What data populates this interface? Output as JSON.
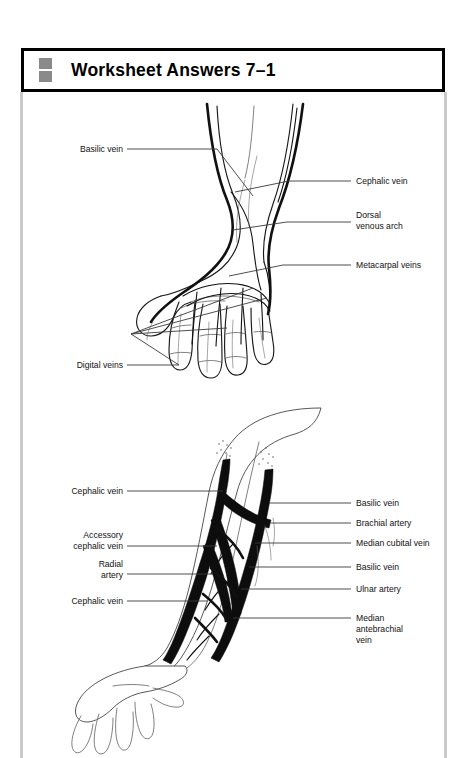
{
  "page": {
    "background_color": "#ffffff",
    "rail_color": "#c9c9c9",
    "ink_color": "#111111"
  },
  "header": {
    "title": "Worksheet Answers 7–1",
    "icon_name": "two-stacked-squares-icon",
    "icon_color": "#8a8a8a",
    "border_color": "#000000"
  },
  "figures": [
    {
      "id": "dorsal-hand-veins",
      "caption": "Dorsal view of hand and wrist superficial veins",
      "labels_left": [
        {
          "text": "Basilic vein",
          "x": 42,
          "y": 56
        },
        {
          "text": "Digital veins",
          "x": 42,
          "y": 272
        }
      ],
      "labels_right": [
        {
          "text": "Cephalic vein",
          "x": 335,
          "y": 88
        },
        {
          "text": "Dorsal",
          "x": 335,
          "y": 122
        },
        {
          "text": "venous arch",
          "x": 335,
          "y": 133
        },
        {
          "text": "Metacarpal veins",
          "x": 335,
          "y": 172
        }
      ]
    },
    {
      "id": "anterior-forearm-veins",
      "caption": "Anterior view of forearm veins and arteries",
      "labels_left": [
        {
          "text": "Cephalic vein",
          "x": 185,
          "y": 98
        },
        {
          "text": "Accessory",
          "x": 185,
          "y": 142
        },
        {
          "text": "cephalic vein",
          "x": 185,
          "y": 153
        },
        {
          "text": "Radial",
          "x": 185,
          "y": 171
        },
        {
          "text": "artery",
          "x": 185,
          "y": 182
        },
        {
          "text": "Cephalic vein",
          "x": 185,
          "y": 208
        }
      ],
      "labels_right": [
        {
          "text": "Basilic vein",
          "x": 335,
          "y": 110
        },
        {
          "text": "Brachial artery",
          "x": 335,
          "y": 130
        },
        {
          "text": "Median cubital vein",
          "x": 335,
          "y": 150
        },
        {
          "text": "Basilic vein",
          "x": 335,
          "y": 174
        },
        {
          "text": "Ulnar artery",
          "x": 335,
          "y": 196
        },
        {
          "text": "Median",
          "x": 335,
          "y": 225
        },
        {
          "text": "antebrachial",
          "x": 335,
          "y": 236
        },
        {
          "text": "vein",
          "x": 335,
          "y": 247
        }
      ]
    }
  ]
}
